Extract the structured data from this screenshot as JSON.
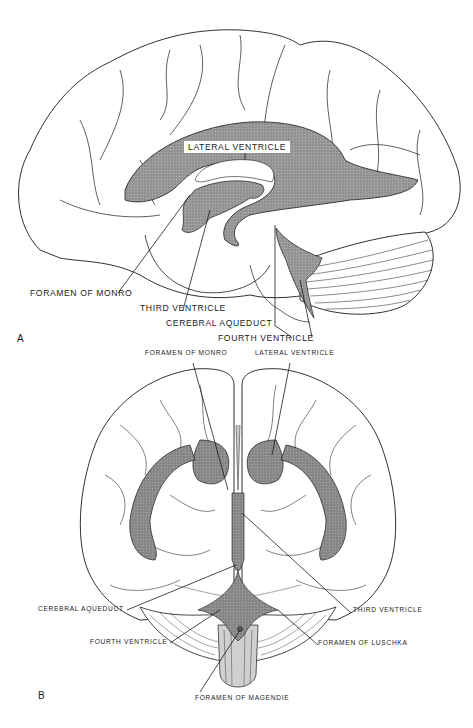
{
  "figure": {
    "colors": {
      "ventricle_fill": "#8f8f8f",
      "outline": "#1a1a1a",
      "background": "#ffffff",
      "brainstem_fill": "#c8c8c8"
    },
    "panel_a": {
      "letter": "A",
      "view": "lateral",
      "labels": {
        "lateral_ventricle": "LATERAL VENTRICLE",
        "foramen_of_monro": "FORAMEN OF MONRO",
        "third_ventricle": "THIRD VENTRICLE",
        "cerebral_aqueduct": "CEREBRAL AQUEDUCT",
        "fourth_ventricle": "FOURTH VENTRICLE"
      }
    },
    "panel_b": {
      "letter": "B",
      "view": "anterior",
      "labels": {
        "foramen_of_monro": "FORAMEN OF MONRO",
        "lateral_ventricle": "LATERAL VENTRICLE",
        "cerebral_aqueduct": "CEREBRAL AQUEDUCT",
        "third_ventricle": "THIRD VENTRICLE",
        "fourth_ventricle": "FOURTH VENTRICLE",
        "foramen_of_luschka": "FORAMEN OF LUSCHKA",
        "foramen_of_magendie": "FORAMEN OF MAGENDIE"
      }
    }
  }
}
